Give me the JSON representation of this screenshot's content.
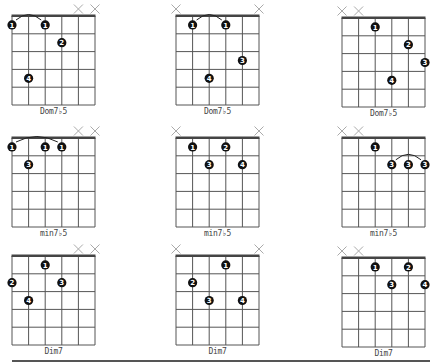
{
  "page": {
    "strings": 6,
    "frets": 5,
    "colors": {
      "grid": "#555555",
      "dot": "#111111",
      "mute": "#aaaaaa"
    }
  },
  "chords": [
    {
      "name": "Dom7♭5",
      "x": 12,
      "y": 16,
      "muted": [
        4,
        5
      ],
      "dots": [
        {
          "s": 0,
          "f": 1,
          "n": "1"
        },
        {
          "s": 2,
          "f": 1,
          "n": "1"
        },
        {
          "s": 3,
          "f": 2,
          "n": "2"
        },
        {
          "s": 1,
          "f": 4,
          "n": "4"
        }
      ],
      "arcs": [
        {
          "from": 0,
          "to": 2
        }
      ]
    },
    {
      "name": "Dom7♭5",
      "x": 176,
      "y": 16,
      "muted": [
        0,
        5
      ],
      "dots": [
        {
          "s": 1,
          "f": 1,
          "n": "1"
        },
        {
          "s": 3,
          "f": 1,
          "n": "1"
        },
        {
          "s": 4,
          "f": 3,
          "n": "3"
        },
        {
          "s": 2,
          "f": 4,
          "n": "4"
        }
      ],
      "arcs": [
        {
          "from": 1,
          "to": 3
        }
      ]
    },
    {
      "name": "Dom7♭5",
      "x": 342,
      "y": 18,
      "muted": [
        0,
        1
      ],
      "dots": [
        {
          "s": 2,
          "f": 1,
          "n": "1"
        },
        {
          "s": 4,
          "f": 2,
          "n": "2"
        },
        {
          "s": 5,
          "f": 3,
          "n": "3"
        },
        {
          "s": 3,
          "f": 4,
          "n": "4"
        }
      ],
      "arcs": []
    },
    {
      "name": "min7♭5",
      "x": 12,
      "y": 138,
      "muted": [
        4,
        5
      ],
      "dots": [
        {
          "s": 0,
          "f": 1,
          "n": "1"
        },
        {
          "s": 2,
          "f": 1,
          "n": "1"
        },
        {
          "s": 3,
          "f": 1,
          "n": "1"
        },
        {
          "s": 1,
          "f": 2,
          "n": "3"
        }
      ],
      "arcs": [
        {
          "from": 0,
          "to": 3
        }
      ]
    },
    {
      "name": "min7♭5",
      "x": 176,
      "y": 138,
      "muted": [
        0,
        5
      ],
      "dots": [
        {
          "s": 1,
          "f": 1,
          "n": "1"
        },
        {
          "s": 3,
          "f": 1,
          "n": "2"
        },
        {
          "s": 2,
          "f": 2,
          "n": "3"
        },
        {
          "s": 4,
          "f": 2,
          "n": "4"
        }
      ],
      "arcs": []
    },
    {
      "name": "min7♭5",
      "x": 342,
      "y": 138,
      "muted": [
        0,
        1
      ],
      "dots": [
        {
          "s": 2,
          "f": 1,
          "n": "1"
        },
        {
          "s": 3,
          "f": 2,
          "n": "3"
        },
        {
          "s": 4,
          "f": 2,
          "n": "3"
        },
        {
          "s": 5,
          "f": 2,
          "n": "3"
        }
      ],
      "arcs": [
        {
          "from": 3,
          "to": 5,
          "fret": 2
        }
      ]
    },
    {
      "name": "Dim7",
      "x": 12,
      "y": 256,
      "muted": [
        4,
        5
      ],
      "dots": [
        {
          "s": 2,
          "f": 1,
          "n": "1"
        },
        {
          "s": 0,
          "f": 2,
          "n": "2"
        },
        {
          "s": 3,
          "f": 2,
          "n": "3"
        },
        {
          "s": 1,
          "f": 3,
          "n": "4"
        }
      ],
      "arcs": []
    },
    {
      "name": "Dim7",
      "x": 176,
      "y": 256,
      "muted": [
        0,
        5
      ],
      "dots": [
        {
          "s": 3,
          "f": 1,
          "n": "1"
        },
        {
          "s": 1,
          "f": 2,
          "n": "2"
        },
        {
          "s": 2,
          "f": 3,
          "n": "3"
        },
        {
          "s": 4,
          "f": 3,
          "n": "4"
        }
      ],
      "arcs": []
    },
    {
      "name": "Dim7",
      "x": 342,
      "y": 258,
      "muted": [
        0,
        1
      ],
      "dots": [
        {
          "s": 2,
          "f": 1,
          "n": "1"
        },
        {
          "s": 4,
          "f": 1,
          "n": "2"
        },
        {
          "s": 3,
          "f": 2,
          "n": "3"
        },
        {
          "s": 5,
          "f": 2,
          "n": "4"
        }
      ],
      "arcs": []
    }
  ]
}
